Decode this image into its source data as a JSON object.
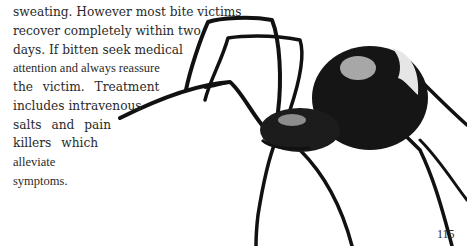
{
  "body_text": {
    "lines": [
      "sweating. However most bite victims",
      "recover completely within two",
      "days. If bitten seek medical",
      "attention and always reassure",
      "the victim. Treatment",
      "includes intravenous",
      "salts and pain",
      "killers which",
      "alleviate",
      "symptoms."
    ]
  },
  "illustration": {
    "subject": "spider-illustration"
  },
  "page_number": "115"
}
